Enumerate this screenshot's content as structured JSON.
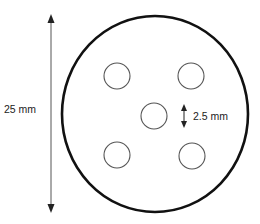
{
  "diagram": {
    "type": "dimensioned-disk-schematic",
    "labels": {
      "diameter": "25 mm",
      "hole_diameter": "2.5 mm"
    },
    "colors": {
      "outline": "#111111",
      "hole_outline": "#555555",
      "arrow": "#222222",
      "text": "#222222",
      "background": "#ffffff"
    },
    "disk": {
      "cx": 155,
      "cy": 114,
      "rx": 93,
      "ry": 98
    },
    "holes": [
      {
        "id": "top-left",
        "cx": 117,
        "cy": 76,
        "r": 13
      },
      {
        "id": "top-right",
        "cx": 191,
        "cy": 76,
        "r": 13
      },
      {
        "id": "center",
        "cx": 154,
        "cy": 116,
        "r": 13
      },
      {
        "id": "bottom-left",
        "cx": 117,
        "cy": 155,
        "r": 13
      },
      {
        "id": "bottom-right",
        "cx": 192,
        "cy": 156,
        "r": 13
      }
    ],
    "hole_count": 5
  }
}
